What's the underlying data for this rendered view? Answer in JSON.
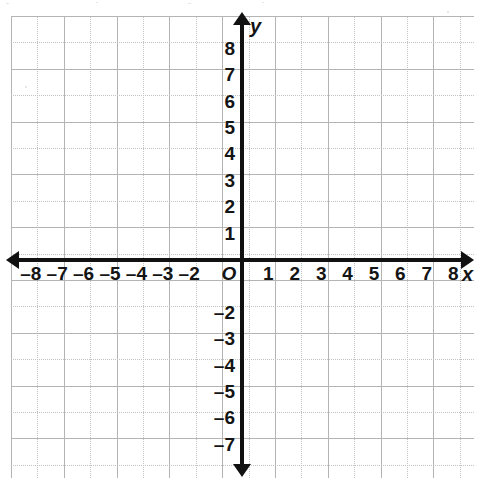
{
  "chart_data": {
    "type": "scatter",
    "title": "",
    "xlabel": "x",
    "ylabel": "y",
    "origin_label": "O",
    "xlim": [
      -8.75,
      8.75
    ],
    "ylim": [
      -8.25,
      9.25
    ],
    "grid": true,
    "legend": null,
    "series": [],
    "x_tick_labels": [
      "–8",
      "–7",
      "–6",
      "–5",
      "–4",
      "–3",
      "–2",
      "1",
      "2",
      "3",
      "4",
      "5",
      "6",
      "7",
      "8"
    ],
    "x_tick_values": [
      -8,
      -7,
      -6,
      -5,
      -4,
      -3,
      -2,
      1,
      2,
      3,
      4,
      5,
      6,
      7,
      8
    ],
    "y_tick_labels": [
      "8",
      "7",
      "6",
      "5",
      "4",
      "3",
      "2",
      "1",
      "–2",
      "–3",
      "–4",
      "–5",
      "–6",
      "–7"
    ],
    "y_tick_values": [
      8,
      7,
      6,
      5,
      4,
      3,
      2,
      1,
      -2,
      -3,
      -4,
      -5,
      -6,
      -7
    ],
    "grid_columns": 17,
    "grid_rows": 17,
    "cell_size_px": 26.4,
    "axis_color": "#111111",
    "grid_color": "#b4b4b4",
    "background_color": "#ffffff"
  },
  "axes": {
    "x_name": "x",
    "y_name": "y",
    "origin": "O"
  },
  "x_ticks": [
    {
      "label": "–8",
      "value": -8
    },
    {
      "label": "–7",
      "value": -7
    },
    {
      "label": "–6",
      "value": -6
    },
    {
      "label": "–5",
      "value": -5
    },
    {
      "label": "–4",
      "value": -4
    },
    {
      "label": "–3",
      "value": -3
    },
    {
      "label": "–2",
      "value": -2
    },
    {
      "label": "1",
      "value": 1
    },
    {
      "label": "2",
      "value": 2
    },
    {
      "label": "3",
      "value": 3
    },
    {
      "label": "4",
      "value": 4
    },
    {
      "label": "5",
      "value": 5
    },
    {
      "label": "6",
      "value": 6
    },
    {
      "label": "7",
      "value": 7
    },
    {
      "label": "8",
      "value": 8
    }
  ],
  "y_ticks": [
    {
      "label": "8",
      "value": 8
    },
    {
      "label": "7",
      "value": 7
    },
    {
      "label": "6",
      "value": 6
    },
    {
      "label": "5",
      "value": 5
    },
    {
      "label": "4",
      "value": 4
    },
    {
      "label": "3",
      "value": 3
    },
    {
      "label": "2",
      "value": 2
    },
    {
      "label": "1",
      "value": 1
    },
    {
      "label": "–2",
      "value": -2
    },
    {
      "label": "–3",
      "value": -3
    },
    {
      "label": "–4",
      "value": -4
    },
    {
      "label": "–5",
      "value": -5
    },
    {
      "label": "–6",
      "value": -6
    },
    {
      "label": "–7",
      "value": -7
    }
  ]
}
